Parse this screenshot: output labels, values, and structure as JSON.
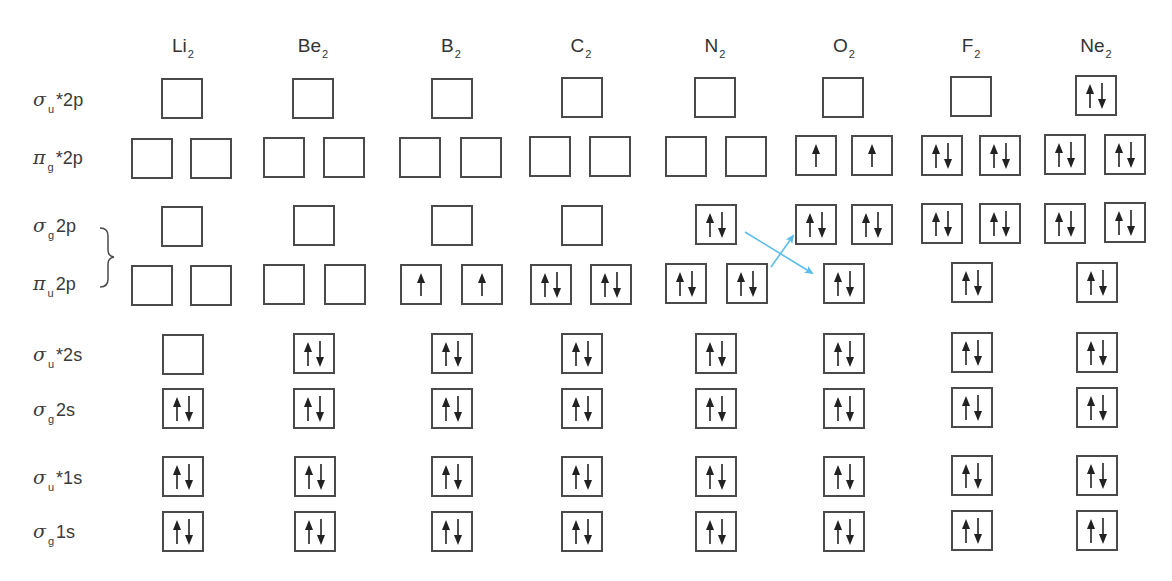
{
  "columns": [
    {
      "base": "Li",
      "sub": "2",
      "x": 183
    },
    {
      "base": "Be",
      "sub": "2",
      "x": 313
    },
    {
      "base": "B",
      "sub": "2",
      "x": 451
    },
    {
      "base": "C",
      "sub": "2",
      "x": 581
    },
    {
      "base": "N",
      "sub": "2",
      "x": 715
    },
    {
      "base": "O",
      "sub": "2",
      "x": 844
    },
    {
      "base": "F",
      "sub": "2",
      "x": 971
    },
    {
      "base": "Ne",
      "sub": "2",
      "x": 1096
    }
  ],
  "rows": [
    {
      "id": "sigma_u_star_2p",
      "greek": "σ",
      "sub": "u",
      "suffix": "*2p",
      "label_y": 88,
      "box_y": 78
    },
    {
      "id": "pi_g_star_2p",
      "greek": "π",
      "sub": "g",
      "suffix": "*2p",
      "label_y": 146,
      "box_y": 138
    },
    {
      "id": "sigma_g_2p",
      "greek": "σ",
      "sub": "g",
      "suffix": "2p",
      "label_y": 214,
      "box_y": 205
    },
    {
      "id": "pi_u_2p",
      "greek": "π",
      "sub": "u",
      "suffix": "2p",
      "label_y": 272,
      "box_y": 264
    },
    {
      "id": "sigma_u_star_2s",
      "greek": "σ",
      "sub": "u",
      "suffix": "*2s",
      "label_y": 343,
      "box_y": 334
    },
    {
      "id": "sigma_g_2s",
      "greek": "σ",
      "sub": "g",
      "suffix": "2s",
      "label_y": 398,
      "box_y": 388
    },
    {
      "id": "sigma_u_star_1s",
      "greek": "σ",
      "sub": "u",
      "suffix": "*1s",
      "label_y": 466,
      "box_y": 456
    },
    {
      "id": "sigma_g_1s",
      "greek": "σ",
      "sub": "g",
      "suffix": "1s",
      "label_y": 520,
      "box_y": 511
    }
  ],
  "occupancy_legend": {
    "0": "empty",
    "1": "one electron (spin up)",
    "2": "paired electrons (up/down)"
  },
  "configurations": {
    "Li2": {
      "sigma_u_star_2p": [
        0
      ],
      "pi_g_star_2p": [
        0,
        0
      ],
      "sigma_g_2p": [
        0
      ],
      "pi_u_2p": [
        0,
        0
      ],
      "sigma_u_star_2s": [
        0
      ],
      "sigma_g_2s": [
        2
      ],
      "sigma_u_star_1s": [
        2
      ],
      "sigma_g_1s": [
        2
      ]
    },
    "Be2": {
      "sigma_u_star_2p": [
        0
      ],
      "pi_g_star_2p": [
        0,
        0
      ],
      "sigma_g_2p": [
        0
      ],
      "pi_u_2p": [
        0,
        0
      ],
      "sigma_u_star_2s": [
        2
      ],
      "sigma_g_2s": [
        2
      ],
      "sigma_u_star_1s": [
        2
      ],
      "sigma_g_1s": [
        2
      ]
    },
    "B2": {
      "sigma_u_star_2p": [
        0
      ],
      "pi_g_star_2p": [
        0,
        0
      ],
      "sigma_g_2p": [
        0
      ],
      "pi_u_2p": [
        1,
        1
      ],
      "sigma_u_star_2s": [
        2
      ],
      "sigma_g_2s": [
        2
      ],
      "sigma_u_star_1s": [
        2
      ],
      "sigma_g_1s": [
        2
      ]
    },
    "C2": {
      "sigma_u_star_2p": [
        0
      ],
      "pi_g_star_2p": [
        0,
        0
      ],
      "sigma_g_2p": [
        0
      ],
      "pi_u_2p": [
        2,
        2
      ],
      "sigma_u_star_2s": [
        2
      ],
      "sigma_g_2s": [
        2
      ],
      "sigma_u_star_1s": [
        2
      ],
      "sigma_g_1s": [
        2
      ]
    },
    "N2": {
      "sigma_u_star_2p": [
        0
      ],
      "pi_g_star_2p": [
        0,
        0
      ],
      "sigma_g_2p": [
        2
      ],
      "pi_u_2p": [
        2,
        2
      ],
      "sigma_u_star_2s": [
        2
      ],
      "sigma_g_2s": [
        2
      ],
      "sigma_u_star_1s": [
        2
      ],
      "sigma_g_1s": [
        2
      ]
    },
    "O2": {
      "sigma_u_star_2p": [
        0
      ],
      "pi_g_star_2p": [
        1,
        1
      ],
      "upper_2p_row_pi": [
        2,
        2
      ],
      "lower_2p_row_sigma": [
        2
      ],
      "sigma_u_star_2s": [
        2
      ],
      "sigma_g_2s": [
        2
      ],
      "sigma_u_star_1s": [
        2
      ],
      "sigma_g_1s": [
        2
      ]
    },
    "F2": {
      "sigma_u_star_2p": [
        0
      ],
      "pi_g_star_2p": [
        2,
        2
      ],
      "upper_2p_row_pi": [
        2,
        2
      ],
      "lower_2p_row_sigma": [
        2
      ],
      "sigma_u_star_2s": [
        2
      ],
      "sigma_g_2s": [
        2
      ],
      "sigma_u_star_1s": [
        2
      ],
      "sigma_g_1s": [
        2
      ]
    },
    "Ne2": {
      "sigma_u_star_2p": [
        2
      ],
      "pi_g_star_2p": [
        2,
        2
      ],
      "upper_2p_row_pi": [
        2,
        2
      ],
      "lower_2p_row_sigma": [
        2
      ],
      "sigma_u_star_2s": [
        2
      ],
      "sigma_g_2s": [
        2
      ],
      "sigma_u_star_1s": [
        2
      ],
      "sigma_g_1s": [
        2
      ]
    }
  },
  "boxes": [
    {
      "col": "Li2",
      "row": "sigma_u_star_2p",
      "x": 161,
      "y": 78,
      "occ": 0
    },
    {
      "col": "Li2",
      "row": "pi_g_star_2p",
      "x": 131,
      "y": 138,
      "occ": 0
    },
    {
      "col": "Li2",
      "row": "pi_g_star_2p",
      "x": 190,
      "y": 138,
      "occ": 0
    },
    {
      "col": "Li2",
      "row": "sigma_g_2p",
      "x": 161,
      "y": 206,
      "occ": 0
    },
    {
      "col": "Li2",
      "row": "pi_u_2p",
      "x": 131,
      "y": 265,
      "occ": 0
    },
    {
      "col": "Li2",
      "row": "pi_u_2p",
      "x": 190,
      "y": 265,
      "occ": 0
    },
    {
      "col": "Li2",
      "row": "sigma_u_star_2s",
      "x": 162,
      "y": 334,
      "occ": 0
    },
    {
      "col": "Li2",
      "row": "sigma_g_2s",
      "x": 162,
      "y": 388,
      "occ": 2
    },
    {
      "col": "Li2",
      "row": "sigma_u_star_1s",
      "x": 162,
      "y": 456,
      "occ": 2
    },
    {
      "col": "Li2",
      "row": "sigma_g_1s",
      "x": 162,
      "y": 511,
      "occ": 2
    },
    {
      "col": "Be2",
      "row": "sigma_u_star_2p",
      "x": 292,
      "y": 78,
      "occ": 0
    },
    {
      "col": "Be2",
      "row": "pi_g_star_2p",
      "x": 263,
      "y": 137,
      "occ": 0
    },
    {
      "col": "Be2",
      "row": "pi_g_star_2p",
      "x": 323,
      "y": 137,
      "occ": 0
    },
    {
      "col": "Be2",
      "row": "sigma_g_2p",
      "x": 293,
      "y": 205,
      "occ": 0
    },
    {
      "col": "Be2",
      "row": "pi_u_2p",
      "x": 263,
      "y": 264,
      "occ": 0
    },
    {
      "col": "Be2",
      "row": "pi_u_2p",
      "x": 324,
      "y": 264,
      "occ": 0
    },
    {
      "col": "Be2",
      "row": "sigma_u_star_2s",
      "x": 293,
      "y": 333,
      "occ": 2
    },
    {
      "col": "Be2",
      "row": "sigma_g_2s",
      "x": 293,
      "y": 388,
      "occ": 2
    },
    {
      "col": "Be2",
      "row": "sigma_u_star_1s",
      "x": 294,
      "y": 456,
      "occ": 2
    },
    {
      "col": "Be2",
      "row": "sigma_g_1s",
      "x": 294,
      "y": 511,
      "occ": 2
    },
    {
      "col": "B2",
      "row": "sigma_u_star_2p",
      "x": 431,
      "y": 78,
      "occ": 0
    },
    {
      "col": "B2",
      "row": "pi_g_star_2p",
      "x": 399,
      "y": 137,
      "occ": 0
    },
    {
      "col": "B2",
      "row": "pi_g_star_2p",
      "x": 460,
      "y": 137,
      "occ": 0
    },
    {
      "col": "B2",
      "row": "sigma_g_2p",
      "x": 431,
      "y": 205,
      "occ": 0
    },
    {
      "col": "B2",
      "row": "pi_u_2p",
      "x": 400,
      "y": 264,
      "occ": 1
    },
    {
      "col": "B2",
      "row": "pi_u_2p",
      "x": 461,
      "y": 264,
      "occ": 1
    },
    {
      "col": "B2",
      "row": "sigma_u_star_2s",
      "x": 431,
      "y": 333,
      "occ": 2
    },
    {
      "col": "B2",
      "row": "sigma_g_2s",
      "x": 431,
      "y": 388,
      "occ": 2
    },
    {
      "col": "B2",
      "row": "sigma_u_star_1s",
      "x": 431,
      "y": 456,
      "occ": 2
    },
    {
      "col": "B2",
      "row": "sigma_g_1s",
      "x": 431,
      "y": 511,
      "occ": 2
    },
    {
      "col": "C2",
      "row": "sigma_u_star_2p",
      "x": 561,
      "y": 77,
      "occ": 0
    },
    {
      "col": "C2",
      "row": "pi_g_star_2p",
      "x": 529,
      "y": 136,
      "occ": 0
    },
    {
      "col": "C2",
      "row": "pi_g_star_2p",
      "x": 589,
      "y": 136,
      "occ": 0
    },
    {
      "col": "C2",
      "row": "sigma_g_2p",
      "x": 561,
      "y": 205,
      "occ": 0
    },
    {
      "col": "C2",
      "row": "pi_u_2p",
      "x": 530,
      "y": 264,
      "occ": 2
    },
    {
      "col": "C2",
      "row": "pi_u_2p",
      "x": 590,
      "y": 264,
      "occ": 2
    },
    {
      "col": "C2",
      "row": "sigma_u_star_2s",
      "x": 561,
      "y": 333,
      "occ": 2
    },
    {
      "col": "C2",
      "row": "sigma_g_2s",
      "x": 561,
      "y": 388,
      "occ": 2
    },
    {
      "col": "C2",
      "row": "sigma_u_star_1s",
      "x": 561,
      "y": 456,
      "occ": 2
    },
    {
      "col": "C2",
      "row": "sigma_g_1s",
      "x": 561,
      "y": 511,
      "occ": 2
    },
    {
      "col": "N2",
      "row": "sigma_u_star_2p",
      "x": 694,
      "y": 77,
      "occ": 0
    },
    {
      "col": "N2",
      "row": "pi_g_star_2p",
      "x": 665,
      "y": 136,
      "occ": 0
    },
    {
      "col": "N2",
      "row": "pi_g_star_2p",
      "x": 725,
      "y": 136,
      "occ": 0
    },
    {
      "col": "N2",
      "row": "sigma_g_2p",
      "x": 695,
      "y": 204,
      "occ": 2
    },
    {
      "col": "N2",
      "row": "pi_u_2p",
      "x": 665,
      "y": 263,
      "occ": 2
    },
    {
      "col": "N2",
      "row": "pi_u_2p",
      "x": 726,
      "y": 263,
      "occ": 2
    },
    {
      "col": "N2",
      "row": "sigma_u_star_2s",
      "x": 695,
      "y": 333,
      "occ": 2
    },
    {
      "col": "N2",
      "row": "sigma_g_2s",
      "x": 695,
      "y": 388,
      "occ": 2
    },
    {
      "col": "N2",
      "row": "sigma_u_star_1s",
      "x": 695,
      "y": 456,
      "occ": 2
    },
    {
      "col": "N2",
      "row": "sigma_g_1s",
      "x": 695,
      "y": 511,
      "occ": 2
    },
    {
      "col": "O2",
      "row": "sigma_u_star_2p",
      "x": 822,
      "y": 77,
      "occ": 0
    },
    {
      "col": "O2",
      "row": "pi_g_star_2p",
      "x": 795,
      "y": 135,
      "occ": 1
    },
    {
      "col": "O2",
      "row": "pi_g_star_2p",
      "x": 851,
      "y": 135,
      "occ": 1
    },
    {
      "col": "O2",
      "row": "pi_u_2p",
      "x": 795,
      "y": 204,
      "occ": 2
    },
    {
      "col": "O2",
      "row": "pi_u_2p",
      "x": 851,
      "y": 204,
      "occ": 2
    },
    {
      "col": "O2",
      "row": "sigma_g_2p",
      "x": 823,
      "y": 263,
      "occ": 2
    },
    {
      "col": "O2",
      "row": "sigma_u_star_2s",
      "x": 823,
      "y": 333,
      "occ": 2
    },
    {
      "col": "O2",
      "row": "sigma_g_2s",
      "x": 823,
      "y": 388,
      "occ": 2
    },
    {
      "col": "O2",
      "row": "sigma_u_star_1s",
      "x": 823,
      "y": 456,
      "occ": 2
    },
    {
      "col": "O2",
      "row": "sigma_g_1s",
      "x": 823,
      "y": 511,
      "occ": 2
    },
    {
      "col": "F2",
      "row": "sigma_u_star_2p",
      "x": 950,
      "y": 76,
      "occ": 0
    },
    {
      "col": "F2",
      "row": "pi_g_star_2p",
      "x": 921,
      "y": 135,
      "occ": 2
    },
    {
      "col": "F2",
      "row": "pi_g_star_2p",
      "x": 979,
      "y": 135,
      "occ": 2
    },
    {
      "col": "F2",
      "row": "pi_u_2p",
      "x": 921,
      "y": 203,
      "occ": 2
    },
    {
      "col": "F2",
      "row": "pi_u_2p",
      "x": 979,
      "y": 203,
      "occ": 2
    },
    {
      "col": "F2",
      "row": "sigma_g_2p",
      "x": 951,
      "y": 262,
      "occ": 2
    },
    {
      "col": "F2",
      "row": "sigma_u_star_2s",
      "x": 951,
      "y": 332,
      "occ": 2
    },
    {
      "col": "F2",
      "row": "sigma_g_2s",
      "x": 951,
      "y": 387,
      "occ": 2
    },
    {
      "col": "F2",
      "row": "sigma_u_star_1s",
      "x": 951,
      "y": 455,
      "occ": 2
    },
    {
      "col": "F2",
      "row": "sigma_g_1s",
      "x": 951,
      "y": 510,
      "occ": 2
    },
    {
      "col": "Ne2",
      "row": "sigma_u_star_2p",
      "x": 1075,
      "y": 75,
      "occ": 2
    },
    {
      "col": "Ne2",
      "row": "pi_g_star_2p",
      "x": 1044,
      "y": 134,
      "occ": 2
    },
    {
      "col": "Ne2",
      "row": "pi_g_star_2p",
      "x": 1104,
      "y": 134,
      "occ": 2
    },
    {
      "col": "Ne2",
      "row": "pi_u_2p",
      "x": 1044,
      "y": 203,
      "occ": 2
    },
    {
      "col": "Ne2",
      "row": "pi_u_2p",
      "x": 1104,
      "y": 202,
      "occ": 2
    },
    {
      "col": "Ne2",
      "row": "sigma_g_2p",
      "x": 1076,
      "y": 262,
      "occ": 2
    },
    {
      "col": "Ne2",
      "row": "sigma_u_star_2s",
      "x": 1076,
      "y": 332,
      "occ": 2
    },
    {
      "col": "Ne2",
      "row": "sigma_g_2s",
      "x": 1076,
      "y": 387,
      "occ": 2
    },
    {
      "col": "Ne2",
      "row": "sigma_u_star_1s",
      "x": 1076,
      "y": 455,
      "occ": 2
    },
    {
      "col": "Ne2",
      "row": "sigma_g_1s",
      "x": 1076,
      "y": 510,
      "occ": 2
    }
  ],
  "annotations": {
    "brace": {
      "label": "σg2p / πu2p ordering group",
      "x": 100,
      "y_top": 227,
      "y_bottom": 287
    },
    "crossing_arrows": [
      {
        "name": "sigma-drops-arrow",
        "from": [
          745,
          232
        ],
        "to": [
          812,
          273
        ]
      },
      {
        "name": "pi-rises-arrow",
        "from": [
          771,
          267
        ],
        "to": [
          793,
          236
        ]
      }
    ],
    "note": "Between N2 and O2 the σg2p and πu2p levels swap order"
  },
  "colors": {
    "box_border": "#4a4a4a",
    "electron_arrow": "#222222",
    "crossing_arrow": "#5bbde8",
    "text": "#333333",
    "background": "#ffffff"
  }
}
